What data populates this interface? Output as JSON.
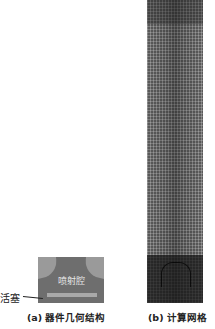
{
  "figure": {
    "panel_a": {
      "caption": "(a) 器件几何结构",
      "chamber_label": "喷射腔",
      "piston_label": "活塞",
      "colors": {
        "body": "#6e6e6e",
        "nozzle_shoulders": "#9a9a9a",
        "piston": "#a9a9a9"
      }
    },
    "panel_b": {
      "caption": "(b) 计算网格",
      "colors": {
        "mesh_base": "#5a5a5a",
        "mesh_dense_bottom": "#2a2a2a"
      }
    }
  }
}
